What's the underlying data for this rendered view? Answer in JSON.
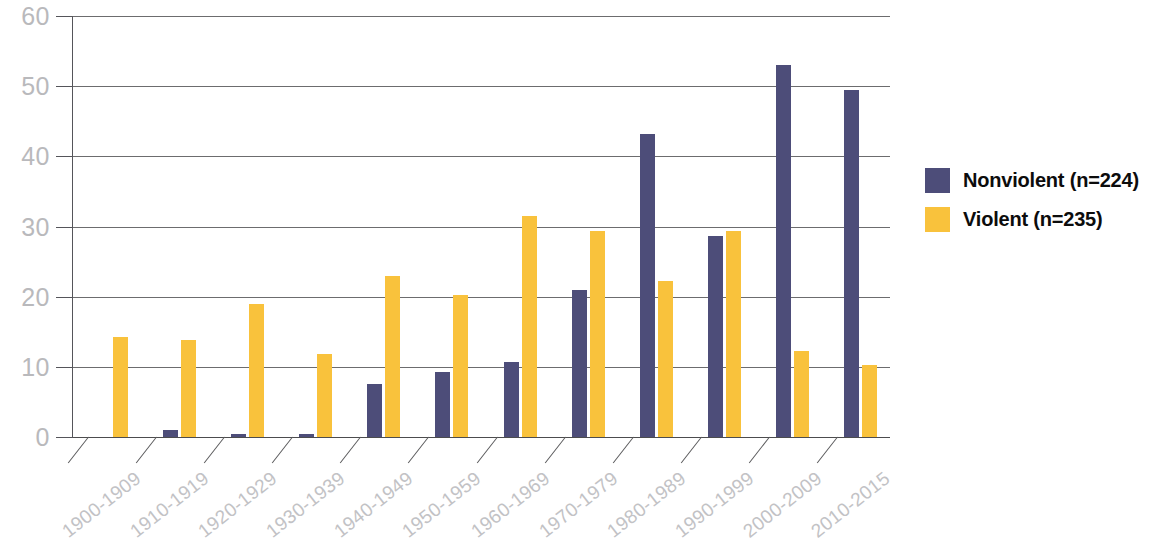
{
  "chart_data": {
    "type": "bar",
    "title": "",
    "subtitle": "",
    "xlabel": "",
    "ylabel": "",
    "ylim": [
      0,
      60
    ],
    "yticks": [
      0,
      10,
      20,
      30,
      40,
      50,
      60
    ],
    "grid": true,
    "legend_position": "right",
    "categories": [
      "1900-1909",
      "1910-1919",
      "1920-1929",
      "1930-1939",
      "1940-1949",
      "1950-1959",
      "1960-1969",
      "1970-1979",
      "1980-1989",
      "1990-1999",
      "2000-2009",
      "2010-2015"
    ],
    "series": [
      {
        "name": "Nonviolent (n=224)",
        "color": "#4d4d79",
        "values": [
          0,
          1.0,
          0.5,
          0.5,
          7.5,
          9.2,
          10.7,
          21.0,
          43.2,
          28.7,
          53.0,
          49.5
        ]
      },
      {
        "name": "Violent (n=235)",
        "color": "#f9c23c",
        "values": [
          14.3,
          13.8,
          19.0,
          11.8,
          23.0,
          20.2,
          31.5,
          29.4,
          22.3,
          29.4,
          12.2,
          10.3
        ]
      }
    ]
  },
  "legend": {
    "items": [
      {
        "label": "Nonviolent (n=224)",
        "color": "#4d4d79",
        "swatch": "nonviolent"
      },
      {
        "label": "Violent (n=235)",
        "color": "#f9c23c",
        "swatch": "violent"
      }
    ]
  },
  "axes": {
    "y_tick_labels": [
      "0",
      "10",
      "20",
      "30",
      "40",
      "50",
      "60"
    ]
  }
}
